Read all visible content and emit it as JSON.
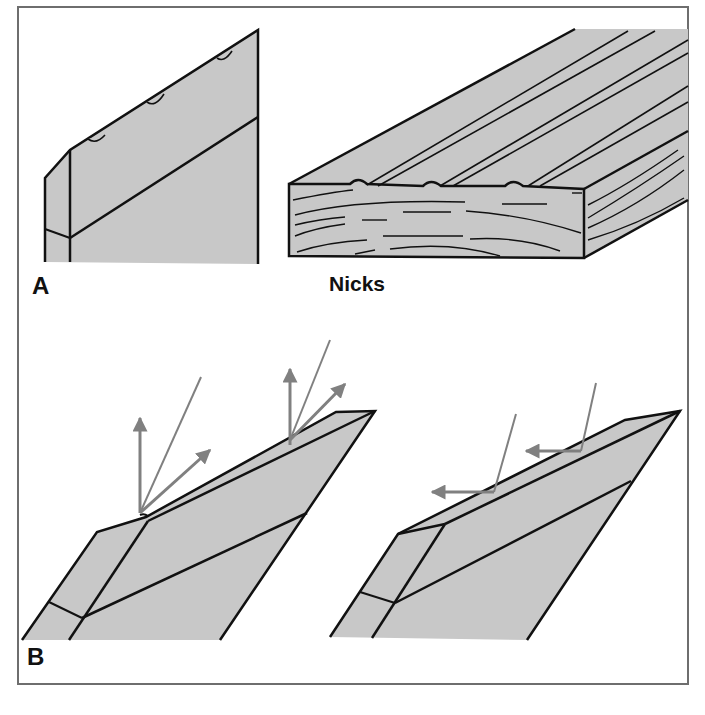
{
  "figure": {
    "panel_a_label": "A",
    "panel_b_label": "B",
    "caption_nicks": "Nicks",
    "colors": {
      "fill": "#c8c8c8",
      "outline": "#111111",
      "arrow": "#808080",
      "border": "#6e6e6e",
      "background": "#ffffff"
    },
    "panel_a": {
      "left": "blade edge with three nicks (side view)",
      "right": "wood board surface with three nick ridges (grain lines)"
    },
    "panel_b": {
      "left": "nicked edge scattering light rays in multiple directions",
      "right": "sharp edge reflecting light rays horizontally"
    }
  }
}
